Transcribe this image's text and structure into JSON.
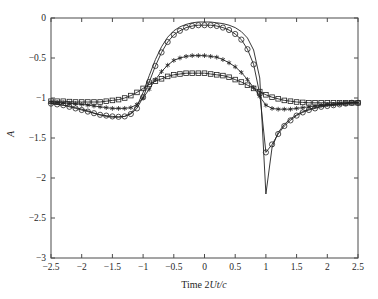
{
  "figure": {
    "background": "#ffffff",
    "line_color": "#222222",
    "axis_color": "#4a4a4a"
  },
  "axes": {
    "x_title_prefix": "Time 2",
    "x_title_italic": "Ut/c",
    "y_title": "A",
    "y_title_rotated": true,
    "x_ticks": [
      "-2.5",
      "-2",
      "-1.5",
      "-1",
      "-0.5",
      "0",
      "0.5",
      "1",
      "1.5",
      "2",
      "2.5"
    ],
    "y_ticks": [
      "0",
      "-0.5",
      "-1",
      "-1.5",
      "-2",
      "-2.5",
      "-3"
    ]
  },
  "chart_data": {
    "type": "line",
    "title": "",
    "xlabel": "Time 2Ut/c",
    "ylabel": "A",
    "xlim": [
      -2.5,
      2.5
    ],
    "ylim": [
      -3,
      0
    ],
    "grid": false,
    "legend": "none",
    "x": [
      -2.5,
      -2.4,
      -2.3,
      -2.2,
      -2.1,
      -2.0,
      -1.9,
      -1.8,
      -1.7,
      -1.6,
      -1.5,
      -1.4,
      -1.3,
      -1.2,
      -1.1,
      -1.0,
      -0.9,
      -0.8,
      -0.7,
      -0.6,
      -0.5,
      -0.4,
      -0.3,
      -0.2,
      -0.1,
      0.0,
      0.1,
      0.2,
      0.3,
      0.4,
      0.5,
      0.6,
      0.7,
      0.8,
      0.9,
      1.0,
      1.1,
      1.2,
      1.3,
      1.4,
      1.5,
      1.6,
      1.7,
      1.8,
      1.9,
      2.0,
      2.1,
      2.2,
      2.3,
      2.4,
      2.5
    ],
    "series": [
      {
        "name": "solid-no-marker",
        "marker": "none",
        "linestyle": "solid",
        "values": [
          -1.07,
          -1.08,
          -1.09,
          -1.1,
          -1.12,
          -1.14,
          -1.16,
          -1.19,
          -1.21,
          -1.23,
          -1.24,
          -1.24,
          -1.23,
          -1.19,
          -1.1,
          -0.93,
          -0.72,
          -0.52,
          -0.36,
          -0.24,
          -0.16,
          -0.11,
          -0.08,
          -0.06,
          -0.05,
          -0.05,
          -0.05,
          -0.06,
          -0.07,
          -0.09,
          -0.12,
          -0.17,
          -0.25,
          -0.4,
          -0.75,
          -2.2,
          -1.62,
          -1.43,
          -1.33,
          -1.26,
          -1.21,
          -1.17,
          -1.14,
          -1.12,
          -1.1,
          -1.09,
          -1.08,
          -1.07,
          -1.06,
          -1.05,
          -1.05
        ]
      },
      {
        "name": "circle-marker",
        "marker": "o",
        "linestyle": "solid",
        "values": [
          -1.07,
          -1.08,
          -1.09,
          -1.11,
          -1.13,
          -1.15,
          -1.17,
          -1.19,
          -1.21,
          -1.22,
          -1.23,
          -1.235,
          -1.23,
          -1.2,
          -1.13,
          -0.99,
          -0.8,
          -0.6,
          -0.43,
          -0.3,
          -0.21,
          -0.16,
          -0.12,
          -0.1,
          -0.09,
          -0.09,
          -0.09,
          -0.1,
          -0.12,
          -0.15,
          -0.2,
          -0.27,
          -0.39,
          -0.58,
          -0.95,
          -1.68,
          -1.58,
          -1.45,
          -1.35,
          -1.28,
          -1.22,
          -1.18,
          -1.15,
          -1.13,
          -1.11,
          -1.1,
          -1.09,
          -1.08,
          -1.07,
          -1.06,
          -1.06
        ]
      },
      {
        "name": "star-marker",
        "marker": "*",
        "linestyle": "solid",
        "values": [
          -1.05,
          -1.055,
          -1.06,
          -1.065,
          -1.07,
          -1.08,
          -1.09,
          -1.1,
          -1.11,
          -1.12,
          -1.13,
          -1.13,
          -1.13,
          -1.12,
          -1.08,
          -1.0,
          -0.89,
          -0.77,
          -0.67,
          -0.59,
          -0.53,
          -0.5,
          -0.48,
          -0.47,
          -0.47,
          -0.47,
          -0.48,
          -0.49,
          -0.52,
          -0.56,
          -0.61,
          -0.68,
          -0.77,
          -0.87,
          -0.98,
          -1.09,
          -1.13,
          -1.14,
          -1.14,
          -1.14,
          -1.13,
          -1.12,
          -1.11,
          -1.1,
          -1.09,
          -1.08,
          -1.08,
          -1.07,
          -1.07,
          -1.06,
          -1.06
        ]
      },
      {
        "name": "square-marker",
        "marker": "s",
        "linestyle": "solid",
        "values": [
          -1.04,
          -1.04,
          -1.04,
          -1.045,
          -1.05,
          -1.05,
          -1.05,
          -1.05,
          -1.05,
          -1.04,
          -1.03,
          -1.02,
          -1.0,
          -0.97,
          -0.93,
          -0.88,
          -0.83,
          -0.79,
          -0.76,
          -0.73,
          -0.71,
          -0.7,
          -0.69,
          -0.69,
          -0.69,
          -0.69,
          -0.7,
          -0.71,
          -0.72,
          -0.74,
          -0.77,
          -0.8,
          -0.84,
          -0.88,
          -0.92,
          -0.96,
          -0.99,
          -1.01,
          -1.03,
          -1.04,
          -1.05,
          -1.055,
          -1.06,
          -1.06,
          -1.06,
          -1.06,
          -1.06,
          -1.06,
          -1.06,
          -1.06,
          -1.06
        ]
      }
    ]
  }
}
